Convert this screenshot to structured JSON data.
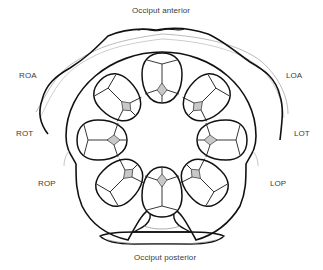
{
  "diagram": {
    "type": "fetal-head-positions-in-pelvis",
    "labels": {
      "top": "Occiput anterior",
      "bottom": "Occiput posterior",
      "left": [
        "ROA",
        "ROT",
        "ROP"
      ],
      "right": [
        "LOA",
        "LOT",
        "LOP"
      ]
    },
    "positions": [
      {
        "code": "OA",
        "angle": 0
      },
      {
        "code": "LOA",
        "angle": 45
      },
      {
        "code": "LOT",
        "angle": 90
      },
      {
        "code": "LOP",
        "angle": 135
      },
      {
        "code": "OP",
        "angle": 180
      },
      {
        "code": "ROP",
        "angle": 225
      },
      {
        "code": "ROT",
        "angle": 270
      },
      {
        "code": "ROA",
        "angle": 315
      }
    ],
    "colors": {
      "line": "#111111",
      "soft_line": "#9a9a9a",
      "fontanelle_fill": "#c8c8c8",
      "label": "#3a3a3a"
    }
  }
}
